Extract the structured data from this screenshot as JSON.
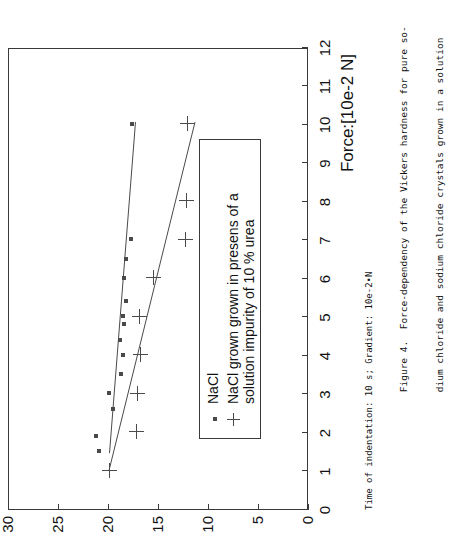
{
  "figure": {
    "yaxis_title": "Vickers hardness",
    "xaxis_title": "Force:[10e-2 N]",
    "footnote": "Time of indentation: 10 s; Gradient: 10e-2•N",
    "caption_line1": "Figure 4.  Force-dependency of the Vickers hardness for pure so-",
    "caption_line2": "dium chloride and sodium chloride crystals grown in a solution"
  },
  "legend": {
    "entries": [
      {
        "marker": "dot-marker",
        "label_line1": "NaCl",
        "label_line2": ""
      },
      {
        "marker": "plus-marker",
        "label_line1": "NaCl grown grown in presens of a",
        "label_line2": "solution impurity of 10 % urea"
      }
    ]
  },
  "chart_data": {
    "type": "scatter",
    "title": "",
    "xlabel": "Force:[10e-2 N]",
    "ylabel": "Vickers hardness",
    "xlim": [
      0,
      12
    ],
    "ylim": [
      0,
      30
    ],
    "xticks": [
      0,
      1,
      2,
      3,
      4,
      5,
      6,
      7,
      8,
      9,
      10,
      11,
      12
    ],
    "yticks": [
      0,
      5,
      10,
      15,
      20,
      25,
      30
    ],
    "grid": false,
    "legend_position": "inside-lower-right",
    "series": [
      {
        "name": "NaCl",
        "marker": "dot",
        "color": "#4a4a4a",
        "points": [
          [
            1.5,
            21.0
          ],
          [
            1.9,
            21.3
          ],
          [
            2.6,
            19.6
          ],
          [
            3.0,
            20.0
          ],
          [
            3.5,
            18.8
          ],
          [
            4.0,
            18.6
          ],
          [
            4.4,
            18.9
          ],
          [
            4.8,
            18.5
          ],
          [
            5.0,
            18.6
          ],
          [
            5.4,
            18.3
          ],
          [
            6.0,
            18.5
          ],
          [
            6.5,
            18.3
          ],
          [
            7.0,
            17.8
          ],
          [
            10.0,
            17.7
          ]
        ],
        "fit_line": {
          "x": [
            1.45,
            10.05
          ],
          "y": [
            19.95,
            17.35
          ]
        }
      },
      {
        "name": "NaCl grown grown in presens of a solution impurity of 10 % urea",
        "marker": "plus",
        "color": "#4a4a4a",
        "points": [
          [
            1.0,
            20.0
          ],
          [
            2.0,
            17.3
          ],
          [
            3.0,
            17.2
          ],
          [
            4.0,
            16.9
          ],
          [
            5.0,
            17.0
          ],
          [
            6.0,
            15.6
          ],
          [
            7.0,
            12.4
          ],
          [
            8.0,
            12.3
          ],
          [
            10.0,
            12.2
          ]
        ],
        "fit_line": {
          "x": [
            1.0,
            10.05
          ],
          "y": [
            20.0,
            11.4
          ]
        }
      }
    ]
  }
}
